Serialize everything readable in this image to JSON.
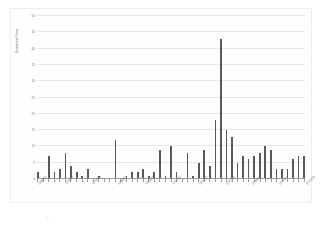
{
  "chart_data": {
    "type": "bar",
    "title": "",
    "xlabel": "",
    "ylabel": "Numbers of firms",
    "ylim": [
      0,
      50
    ],
    "yticks": [
      0,
      5,
      10,
      15,
      20,
      25,
      30,
      35,
      40,
      45,
      50
    ],
    "grid": true,
    "legend": null,
    "bar_color": "#595959",
    "gridline_color": "#e6e6e6",
    "axis_color": "#9a9a9a",
    "categories": [
      "1966/67",
      "1967/68",
      "1968/69",
      "1969/70",
      "1970/71",
      "1971/72",
      "1972/73",
      "1973/74",
      "1974/75",
      "1975/76",
      "1976/77",
      "1977/78",
      "1978/79",
      "1979/80",
      "1980/81",
      "1981/82",
      "1982/83",
      "1983/84",
      "1984/85",
      "1985/86",
      "1986/87",
      "1987/88",
      "1988/89",
      "1989/90",
      "1990/91",
      "1991/92",
      "1992/93",
      "1993/94",
      "1994/95",
      "1995/96",
      "1996/97",
      "1997/98",
      "1998/99",
      "1999/00",
      "2000/01",
      "2001/02",
      "2002/03",
      "2003/04",
      "2004/05",
      "2005/06",
      "2006/07",
      "2007/08",
      "2008/09",
      "2009/10",
      "2010/11",
      "2011/12",
      "2012/13",
      "2013/14",
      "2014/15"
    ],
    "values": [
      2,
      0,
      7,
      2,
      3,
      8,
      4,
      2,
      1,
      3,
      0,
      1,
      0,
      0,
      12,
      0,
      1,
      2,
      2,
      3,
      1,
      2,
      9,
      1,
      10,
      2,
      0,
      8,
      1,
      5,
      9,
      4,
      18,
      43,
      15,
      13,
      5,
      7,
      6,
      7,
      8,
      10,
      9,
      3,
      3,
      3,
      6,
      7,
      7
    ],
    "xtick_labels_shown": [
      "1966/67",
      "1970/71",
      "1974/75",
      "1980/81",
      "1988/89",
      "1991/92",
      "1996/97",
      "2002/03",
      "2006/07",
      "2010/11",
      "2014/15"
    ],
    "annotations": {
      "peak_value": 43,
      "peak_category": "1999/00"
    }
  }
}
